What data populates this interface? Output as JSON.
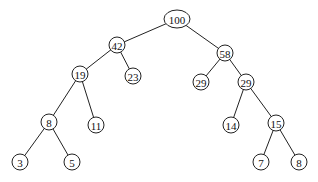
{
  "tree": {
    "nodes": [
      {
        "id": "n100",
        "label": "100",
        "x": 177,
        "y": 19,
        "rx": 13,
        "ry": 9
      },
      {
        "id": "n42",
        "label": "42",
        "x": 117,
        "y": 45,
        "rx": 8,
        "ry": 8
      },
      {
        "id": "n58",
        "label": "58",
        "x": 225,
        "y": 53,
        "rx": 8,
        "ry": 8
      },
      {
        "id": "n19",
        "label": "19",
        "x": 80,
        "y": 74,
        "rx": 8,
        "ry": 8
      },
      {
        "id": "n23",
        "label": "23",
        "x": 133,
        "y": 76,
        "rx": 8,
        "ry": 8
      },
      {
        "id": "n29a",
        "label": "29",
        "x": 201,
        "y": 82,
        "rx": 8,
        "ry": 8
      },
      {
        "id": "n29b",
        "label": "29",
        "x": 246,
        "y": 82,
        "rx": 8,
        "ry": 8
      },
      {
        "id": "n8a",
        "label": "8",
        "x": 49,
        "y": 122,
        "rx": 8,
        "ry": 8
      },
      {
        "id": "n11",
        "label": "11",
        "x": 96,
        "y": 125,
        "rx": 8,
        "ry": 8
      },
      {
        "id": "n14",
        "label": "14",
        "x": 231,
        "y": 125,
        "rx": 8,
        "ry": 8
      },
      {
        "id": "n15",
        "label": "15",
        "x": 276,
        "y": 123,
        "rx": 8,
        "ry": 8
      },
      {
        "id": "n3",
        "label": "3",
        "x": 20,
        "y": 162,
        "rx": 8,
        "ry": 8
      },
      {
        "id": "n5",
        "label": "5",
        "x": 72,
        "y": 162,
        "rx": 8,
        "ry": 8
      },
      {
        "id": "n7",
        "label": "7",
        "x": 261,
        "y": 162,
        "rx": 8,
        "ry": 8
      },
      {
        "id": "n8b",
        "label": "8",
        "x": 299,
        "y": 162,
        "rx": 8,
        "ry": 8
      }
    ],
    "edges": [
      [
        "n100",
        "n42"
      ],
      [
        "n100",
        "n58"
      ],
      [
        "n42",
        "n19"
      ],
      [
        "n42",
        "n23"
      ],
      [
        "n58",
        "n29a"
      ],
      [
        "n58",
        "n29b"
      ],
      [
        "n19",
        "n8a"
      ],
      [
        "n19",
        "n11"
      ],
      [
        "n29b",
        "n14"
      ],
      [
        "n29b",
        "n15"
      ],
      [
        "n8a",
        "n3"
      ],
      [
        "n8a",
        "n5"
      ],
      [
        "n15",
        "n7"
      ],
      [
        "n15",
        "n8b"
      ]
    ]
  }
}
